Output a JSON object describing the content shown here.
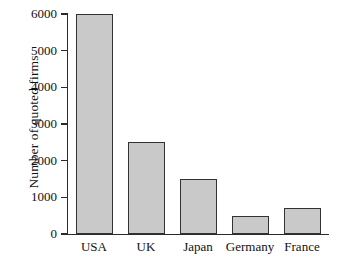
{
  "chart_data": {
    "type": "bar",
    "title": "",
    "subtitle": "",
    "xlabel": "",
    "ylabel": "Number of quoted firms",
    "categories": [
      "USA",
      "UK",
      "Japan",
      "Germany",
      "France"
    ],
    "values": [
      6000,
      2500,
      1500,
      500,
      700
    ],
    "ylim": [
      0,
      6000
    ],
    "yticks": [
      0,
      1000,
      2000,
      3000,
      4000,
      5000,
      6000
    ],
    "ytick_labels": [
      "0",
      "1000",
      "2000",
      "3000",
      "4000",
      "5000",
      "6000"
    ],
    "grid": false,
    "legend": null,
    "legend_position": "none",
    "series": [
      {
        "name": "Number of quoted firms",
        "values": [
          6000,
          2500,
          1500,
          500,
          700
        ]
      }
    ],
    "annotations": []
  },
  "style": {
    "bar_fill": "#c9c9c9",
    "bar_border": "#333333",
    "axis_color": "#2b2b2b",
    "text_color": "#111111",
    "background": "#ffffff"
  }
}
